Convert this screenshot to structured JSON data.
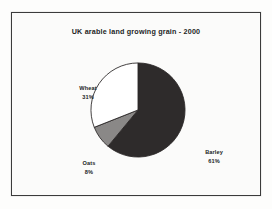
{
  "figure": {
    "frame_border_color": "#3b3b3b",
    "background_color": "#fbfbfa"
  },
  "chart_data": {
    "type": "pie",
    "title": "UK arable land growing grain - 2000",
    "subtitle": "",
    "xlabel": "",
    "ylabel": "",
    "unit": "%",
    "legend_position": "none",
    "grid": false,
    "start_angle_deg": 0,
    "direction": "clockwise",
    "categories": [
      "Barley",
      "Wheat",
      "Oats"
    ],
    "values": [
      61,
      31,
      8
    ],
    "total": 100,
    "slices": [
      {
        "name": "Barley",
        "value": 61,
        "label": "Barley",
        "percent_label": "61%",
        "color": "#2e2b2b",
        "start_deg": 0,
        "end_deg": 219.6
      },
      {
        "name": "Oats",
        "value": 8,
        "label": "Oats",
        "percent_label": "8%",
        "color": "#8a8887",
        "start_deg": 219.6,
        "end_deg": 248.4
      },
      {
        "name": "Wheat",
        "value": 31,
        "label": "Wheat",
        "percent_label": "31%",
        "color": "#ffffff",
        "start_deg": 248.4,
        "end_deg": 360
      }
    ]
  }
}
